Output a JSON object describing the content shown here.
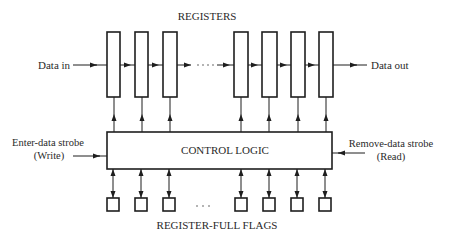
{
  "diagram": {
    "title_top": "REGISTERS",
    "title_bottom": "REGISTER-FULL FLAGS",
    "control_block": "CONTROL LOGIC",
    "inputs": {
      "data_in": "Data in",
      "enter_strobe_line1": "Enter-data strobe",
      "enter_strobe_line2": "(Write)"
    },
    "outputs": {
      "data_out": "Data out",
      "remove_strobe_line1": "Remove-data strobe",
      "remove_strobe_line2": "(Read)"
    },
    "ellipsis": ". . .",
    "registers": [
      {
        "x": 107
      },
      {
        "x": 135
      },
      {
        "x": 163
      },
      {
        "x": 234
      },
      {
        "x": 262
      },
      {
        "x": 291
      },
      {
        "x": 319
      }
    ],
    "flags": [
      {
        "x": 107
      },
      {
        "x": 134
      },
      {
        "x": 163
      },
      {
        "x": 234
      },
      {
        "x": 262
      },
      {
        "x": 291
      },
      {
        "x": 318
      }
    ],
    "colors": {
      "stroke": "#1e1e1e",
      "text": "#2a2a2a",
      "background": "#ffffff"
    }
  }
}
